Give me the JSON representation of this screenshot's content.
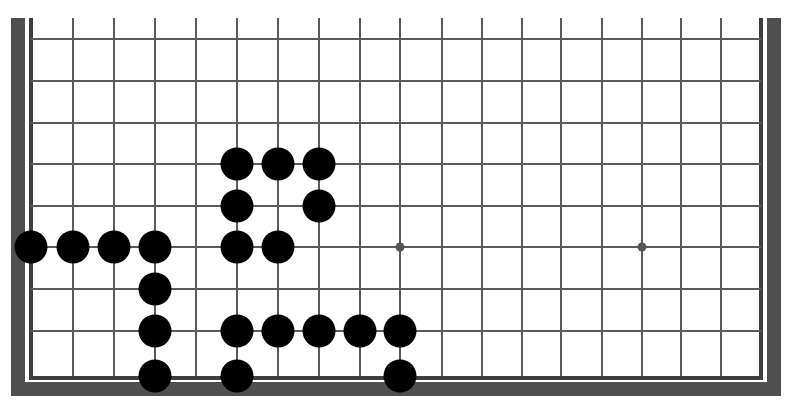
{
  "board": {
    "title": "Go board (partial view)",
    "colors": {
      "frame": "#4f4f4f",
      "inner_border": "#3f3f3f",
      "grid": "#5a5a5a",
      "stone_black": "#000000",
      "star_point": "#555555",
      "background": "#ffffff"
    },
    "columns_x": [
      31,
      73,
      114,
      155,
      196,
      237,
      278,
      319,
      360,
      400,
      442,
      482,
      522,
      561,
      602,
      642,
      681,
      721,
      761
    ],
    "rows_y": [
      39,
      81,
      123,
      164,
      206,
      247,
      289,
      331,
      376
    ],
    "grid_top": 18,
    "stone_radius": 16.5,
    "star_points": [
      {
        "col": 9,
        "row": 5
      },
      {
        "col": 15,
        "row": 5
      }
    ],
    "stones": [
      {
        "color": "black",
        "col": 5,
        "row": 3
      },
      {
        "color": "black",
        "col": 6,
        "row": 3
      },
      {
        "color": "black",
        "col": 7,
        "row": 3
      },
      {
        "color": "black",
        "col": 5,
        "row": 4
      },
      {
        "color": "black",
        "col": 7,
        "row": 4
      },
      {
        "color": "black",
        "col": 0,
        "row": 5
      },
      {
        "color": "black",
        "col": 1,
        "row": 5
      },
      {
        "color": "black",
        "col": 2,
        "row": 5
      },
      {
        "color": "black",
        "col": 3,
        "row": 5
      },
      {
        "color": "black",
        "col": 5,
        "row": 5
      },
      {
        "color": "black",
        "col": 6,
        "row": 5
      },
      {
        "color": "black",
        "col": 3,
        "row": 6
      },
      {
        "color": "black",
        "col": 3,
        "row": 7
      },
      {
        "color": "black",
        "col": 5,
        "row": 7
      },
      {
        "color": "black",
        "col": 6,
        "row": 7
      },
      {
        "color": "black",
        "col": 7,
        "row": 7
      },
      {
        "color": "black",
        "col": 8,
        "row": 7
      },
      {
        "color": "black",
        "col": 9,
        "row": 7
      },
      {
        "color": "black",
        "col": 3,
        "row": 8
      },
      {
        "color": "black",
        "col": 5,
        "row": 8
      },
      {
        "color": "black",
        "col": 9,
        "row": 8
      }
    ]
  }
}
